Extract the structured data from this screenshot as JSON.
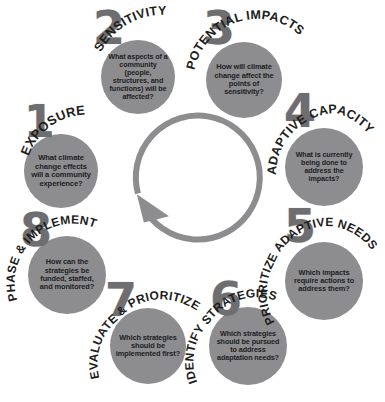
{
  "figure": {
    "arrow_direction": "counter-clockwise",
    "colors": {
      "bubble_fill": "#8d8d8f",
      "numeral": "#6e6e70",
      "arc_label_text": "#1d1d1c",
      "question_text": "#20201f",
      "arrow": "#8d8d8f",
      "background": "#ffffff"
    }
  },
  "steps": [
    {
      "number": "1",
      "label": "EXPOSURE",
      "question": "What climate change effects will a community experience?"
    },
    {
      "number": "2",
      "label": "SENSITIVITY",
      "question": "What aspects of a community (people, structures, and functions) will be affected?"
    },
    {
      "number": "3",
      "label": "POTENTIAL IMPACTS",
      "question": "How will climate change affect the points of sensitivity?"
    },
    {
      "number": "4",
      "label": "ADAPTIVE CAPACITY",
      "question": "What is currently being done to address the impacts?"
    },
    {
      "number": "5",
      "label": "PRIORITIZE ADAPTIVE NEEDS",
      "question": "Which impacts require actions to address them?"
    },
    {
      "number": "6",
      "label": "IDENTIFY STRATEGIES",
      "question": "Which strategies should be pursued to address adaptation needs?"
    },
    {
      "number": "7",
      "label": "EVALUATE & PRIORITIZE",
      "question": "Which strategies should be implemented first?"
    },
    {
      "number": "8",
      "label": "PHASE & IMPLEMENT",
      "question": "How can the strategies be funded, staffed, and monitored?"
    }
  ],
  "caption": ""
}
